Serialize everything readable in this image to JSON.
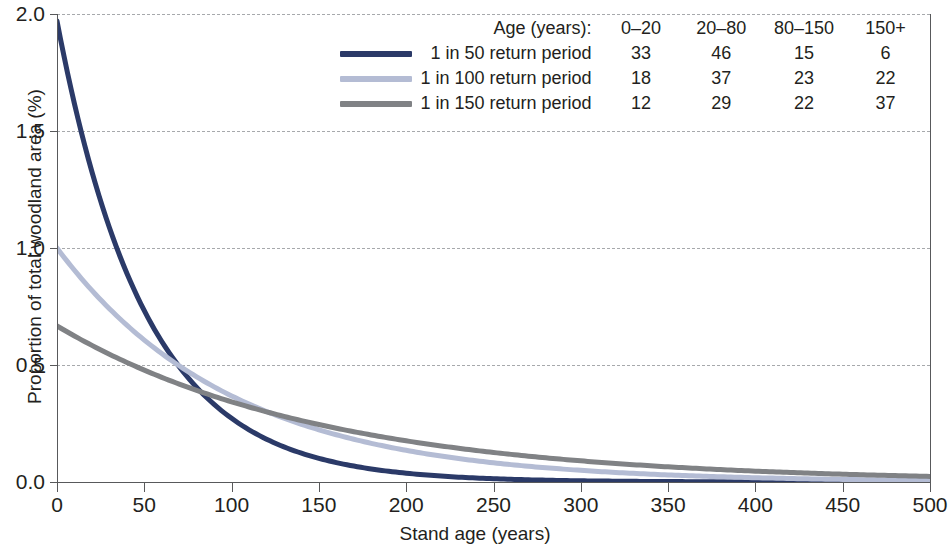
{
  "chart_data": {
    "type": "line",
    "title": "",
    "xlabel": "Stand age (years)",
    "ylabel": "Proportion of total woodland area (%)",
    "xlim": [
      0,
      500
    ],
    "ylim": [
      0.0,
      2.0
    ],
    "xticks": [
      "0",
      "50",
      "100",
      "150",
      "200",
      "250",
      "300",
      "350",
      "400",
      "450",
      "500"
    ],
    "yticks": [
      "0.0",
      "0.5",
      "1.0",
      "1.5",
      "2.0"
    ],
    "grid": "horizontal-dashed",
    "legend_position": "top-right",
    "series": [
      {
        "name": "1 in 50 return period",
        "color": "#2b3a68",
        "initial_value": 1.97,
        "decay_constant": 0.0198,
        "values": [
          1.97,
          1.2,
          0.73,
          0.445,
          0.271,
          0.165,
          0.101,
          0.061,
          0.037,
          0.023,
          0.014
        ]
      },
      {
        "name": "1 in 100 return period",
        "color": "#b4bcd4",
        "initial_value": 1.0,
        "decay_constant": 0.01,
        "values": [
          1.0,
          0.607,
          0.368,
          0.223,
          0.135,
          0.082,
          0.05,
          0.03,
          0.018,
          0.011,
          0.007
        ]
      },
      {
        "name": "1 in 150 return period",
        "color": "#808285",
        "initial_value": 0.667,
        "decay_constant": 0.00666,
        "values": [
          0.667,
          0.478,
          0.343,
          0.246,
          0.176,
          0.126,
          0.091,
          0.065,
          0.047,
          0.033,
          0.024
        ]
      }
    ]
  },
  "legend": {
    "header": {
      "age_label": "Age (years):",
      "bins": [
        "0–20",
        "20–80",
        "80–150",
        "150+"
      ]
    },
    "rows": [
      {
        "name": "1 in 50 return period",
        "color": "#2b3a68",
        "values": [
          "33",
          "46",
          "15",
          "6"
        ]
      },
      {
        "name": "1 in 100 return period",
        "color": "#b4bcd4",
        "values": [
          "18",
          "37",
          "23",
          "22"
        ]
      },
      {
        "name": "1 in 150 return period",
        "color": "#808285",
        "values": [
          "12",
          "29",
          "22",
          "37"
        ]
      }
    ]
  },
  "colors": {
    "axis": "#58595b",
    "grid": "#a7a9ac",
    "text": "#231f20",
    "background": "#ffffff"
  }
}
